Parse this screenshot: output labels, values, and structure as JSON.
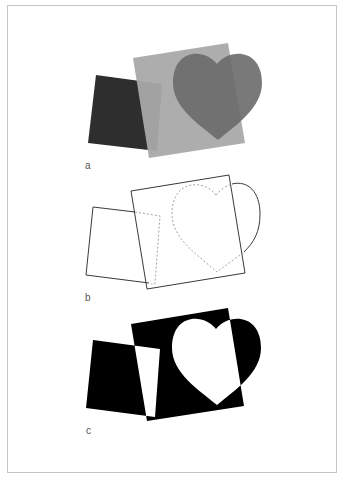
{
  "panels": [
    {
      "id": "a",
      "label": "a",
      "description": "Overlapping filled shapes with transparency"
    },
    {
      "id": "b",
      "label": "b",
      "description": "Outline view with hidden edges dashed"
    },
    {
      "id": "c",
      "label": "c",
      "description": "Even-odd (XOR) fill of combined shapes"
    }
  ],
  "colors": {
    "dark_square": "#2e2e2e",
    "gray_square": "#a9a9a9",
    "heart": "#6f6f6f",
    "heart_over_gray": "#747474",
    "outline": "#3a3a3a",
    "dashed": "#8a8a8a",
    "xor_fill": "#000000",
    "page_border": "#c4c4c4"
  }
}
